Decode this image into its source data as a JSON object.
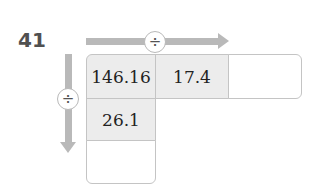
{
  "problem": {
    "number": "41"
  },
  "operators": {
    "horizontal": "÷",
    "vertical": "÷"
  },
  "grid": {
    "row1": [
      "146.16",
      "17.4",
      ""
    ],
    "col1": [
      "146.16",
      "26.1",
      ""
    ]
  },
  "colors": {
    "arrow": "#b9b9b9",
    "filled_cell": "#ececec",
    "empty_cell": "#ffffff",
    "border": "#c4c4c4"
  }
}
